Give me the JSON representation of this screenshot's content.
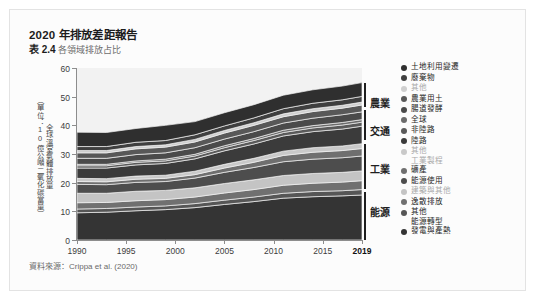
{
  "header": {
    "title": "2020 年排放差距報告",
    "table_number": "表 2.4",
    "subtitle": "各領域排放占比"
  },
  "source_note": "資料來源：Crippa et al. (2020)",
  "sector_labels": [
    {
      "label": "農業",
      "top": 95
    },
    {
      "label": "交通",
      "top": 123
    },
    {
      "label": "工業",
      "top": 161
    },
    {
      "label": "能源",
      "top": 204
    }
  ],
  "legend": {
    "items": [
      {
        "label": "土地利用變遷",
        "color": "#2f2f2f",
        "muted": false
      },
      {
        "label": "廢棄物",
        "color": "#3f3f3f",
        "muted": false
      },
      {
        "label": "其他",
        "color": "#cfcfcf",
        "muted": true
      },
      {
        "label": "農業用土",
        "color": "#585858",
        "muted": false
      },
      {
        "label": "腸道發酵",
        "color": "#4a4a4a",
        "muted": false
      },
      {
        "label": "全球",
        "color": "#6b6b6b",
        "muted": false
      },
      {
        "label": "非陸路",
        "color": "#5a5a5a",
        "muted": false
      },
      {
        "label": "陸路",
        "color": "#3b3b3b",
        "muted": false
      },
      {
        "label": "其他\n工業製程",
        "color": "#c9c9c9",
        "muted": true
      },
      {
        "label": "礦產",
        "color": "#6f6f6f",
        "muted": false
      },
      {
        "label": "能源使用",
        "color": "#4d4d4d",
        "muted": false
      },
      {
        "label": "建築與其他",
        "color": "#c4c4c4",
        "muted": true
      },
      {
        "label": "逸散排放",
        "color": "#707070",
        "muted": false
      },
      {
        "label": "其他\n能源轉型",
        "color": "#565656",
        "muted": false
      },
      {
        "label": "發電與產熱",
        "color": "#343434",
        "muted": false
      }
    ]
  },
  "chart_data": {
    "type": "area",
    "title": "各領域排放占比",
    "xlabel": "",
    "ylabel": "全球溫室氣體排放量（單位：10億公噸二氧化碳當量）",
    "ylabel_parts": [
      "全球溫室氣體排放量",
      "（單位：10億公噸二氧化碳當量）"
    ],
    "xlim": [
      1990,
      2019
    ],
    "ylim": [
      0,
      60
    ],
    "ytick_values": [
      0,
      10,
      20,
      30,
      40,
      50,
      60
    ],
    "xtick_values": [
      1990,
      1995,
      2000,
      2005,
      2010,
      2015,
      2019
    ],
    "xtick_labels": [
      "1990",
      "1995",
      "2000",
      "2005",
      "2010",
      "2015",
      "2019"
    ],
    "grid": false,
    "legend_position": "right",
    "stacked": true,
    "x": [
      1990,
      1993,
      1996,
      1999,
      2002,
      2005,
      2008,
      2011,
      2014,
      2017,
      2019
    ],
    "series": [
      {
        "name": "發電與產熱",
        "color": "#343434",
        "values": [
          9.5,
          9.7,
          10.2,
          10.6,
          11.3,
          12.4,
          13.4,
          14.6,
          15.1,
          15.4,
          15.7
        ]
      },
      {
        "name": "其他能源轉型",
        "color": "#565656",
        "values": [
          1.3,
          1.3,
          1.3,
          1.3,
          1.4,
          1.5,
          1.6,
          1.7,
          1.8,
          1.8,
          1.9
        ]
      },
      {
        "name": "逸散排放",
        "color": "#707070",
        "values": [
          2.2,
          2.1,
          2.2,
          2.2,
          2.3,
          2.5,
          2.6,
          2.8,
          2.9,
          3.0,
          3.1
        ]
      },
      {
        "name": "建築與其他",
        "color": "#c4c4c4",
        "values": [
          3.3,
          3.2,
          3.3,
          3.2,
          3.2,
          3.3,
          3.4,
          3.4,
          3.4,
          3.4,
          3.4
        ]
      },
      {
        "name": "能源使用",
        "color": "#4d4d4d",
        "values": [
          3.1,
          3.0,
          3.1,
          3.1,
          3.4,
          3.9,
          4.3,
          4.8,
          5.0,
          5.1,
          5.2
        ]
      },
      {
        "name": "礦產",
        "color": "#6f6f6f",
        "values": [
          1.0,
          1.0,
          1.1,
          1.1,
          1.2,
          1.5,
          1.8,
          2.2,
          2.4,
          2.5,
          2.6
        ]
      },
      {
        "name": "其他工業製程",
        "color": "#c9c9c9",
        "values": [
          1.1,
          1.1,
          1.1,
          1.1,
          1.2,
          1.3,
          1.4,
          1.5,
          1.6,
          1.6,
          1.7
        ]
      },
      {
        "name": "陸路",
        "color": "#3b3b3b",
        "values": [
          3.6,
          3.7,
          3.9,
          4.1,
          4.3,
          4.7,
          5.0,
          5.3,
          5.6,
          5.9,
          6.1
        ]
      },
      {
        "name": "非陸路",
        "color": "#5a5a5a",
        "values": [
          0.8,
          0.8,
          0.9,
          0.9,
          1.0,
          1.1,
          1.2,
          1.2,
          1.3,
          1.4,
          1.4
        ]
      },
      {
        "name": "全球",
        "color": "#6b6b6b",
        "values": [
          0.5,
          0.5,
          0.5,
          0.6,
          0.6,
          0.7,
          0.7,
          0.8,
          0.8,
          0.9,
          0.9
        ]
      },
      {
        "name": "腸道發酵",
        "color": "#4a4a4a",
        "values": [
          2.1,
          2.1,
          2.2,
          2.2,
          2.3,
          2.3,
          2.4,
          2.5,
          2.6,
          2.7,
          2.7
        ]
      },
      {
        "name": "農業用土",
        "color": "#585858",
        "values": [
          1.9,
          1.9,
          2.0,
          2.0,
          2.0,
          2.1,
          2.2,
          2.2,
          2.3,
          2.3,
          2.4
        ]
      },
      {
        "name": "其他",
        "color": "#cfcfcf",
        "values": [
          0.8,
          0.8,
          0.8,
          0.8,
          0.9,
          0.9,
          0.9,
          1.0,
          1.0,
          1.0,
          1.0
        ]
      },
      {
        "name": "廢棄物",
        "color": "#3f3f3f",
        "values": [
          1.4,
          1.4,
          1.5,
          1.5,
          1.6,
          1.6,
          1.7,
          1.8,
          1.9,
          1.9,
          2.0
        ]
      },
      {
        "name": "土地利用變遷",
        "color": "#2f2f2f",
        "values": [
          5.0,
          4.9,
          4.8,
          5.3,
          4.6,
          4.6,
          4.6,
          4.7,
          4.7,
          4.8,
          4.8
        ]
      }
    ]
  }
}
